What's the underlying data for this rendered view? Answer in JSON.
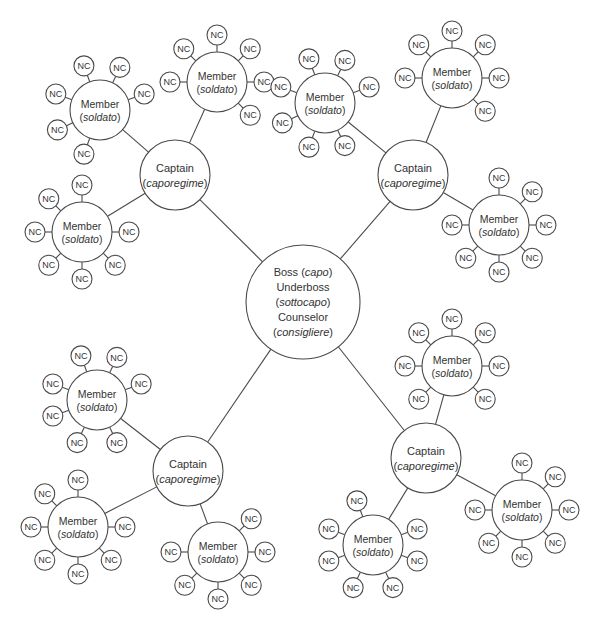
{
  "diagram": {
    "boss": {
      "x": 303,
      "y": 302,
      "r": 57,
      "lines": [
        {
          "text": "Boss (",
          "italic": "capo",
          "after": ")"
        },
        {
          "text": "Underboss",
          "italic": "",
          "after": ""
        },
        {
          "text": "(",
          "italic": "sottocapo",
          "after": ")"
        },
        {
          "text": "Counselor",
          "italic": "",
          "after": ""
        },
        {
          "text": "(",
          "italic": "consigliere",
          "after": ")"
        }
      ]
    },
    "captain_label": {
      "line1": "Captain",
      "line2_pre": "(",
      "line2_italic": "caporegime",
      "line2_post": ")"
    },
    "member_label": {
      "line1": "Member",
      "line2_pre": "(",
      "line2_italic": "soldato",
      "line2_post": ")"
    },
    "nc_label": "NC",
    "captains": [
      {
        "id": "top-left",
        "x": 175,
        "y": 175,
        "r": 35,
        "members": [
          {
            "x": 100,
            "y": 110,
            "r": 30,
            "nc_angles": [
              250,
              295,
              340,
              20,
              60,
              110,
              155,
              200
            ]
          },
          {
            "x": 217,
            "y": 82,
            "r": 30,
            "nc_angles": [
              270,
              225,
              315,
              0,
              180,
              45,
              90,
              135
            ]
          },
          {
            "x": 82,
            "y": 232,
            "r": 30,
            "nc_angles": [
              270,
              225,
              315,
              0,
              180,
              45,
              90,
              135
            ]
          }
        ]
      },
      {
        "id": "top-right",
        "x": 413,
        "y": 175,
        "r": 35,
        "members": [
          {
            "x": 325,
            "y": 103,
            "r": 30,
            "nc_angles": [
              250,
              295,
              340,
              20,
              200,
              110,
              155,
              65
            ]
          },
          {
            "x": 452,
            "y": 78,
            "r": 30,
            "nc_angles": [
              270,
              225,
              315,
              0,
              180,
              45,
              90,
              135
            ]
          },
          {
            "x": 499,
            "y": 225,
            "r": 30,
            "nc_angles": [
              270,
              225,
              315,
              0,
              180,
              45,
              90,
              135
            ]
          }
        ]
      },
      {
        "id": "bottom-left",
        "x": 188,
        "y": 471,
        "r": 35,
        "members": [
          {
            "x": 97,
            "y": 400,
            "r": 30,
            "nc_angles": [
              250,
              295,
              340,
              20,
              200,
              160,
              115,
              65
            ]
          },
          {
            "x": 78,
            "y": 527,
            "r": 30,
            "nc_angles": [
              270,
              225,
              315,
              0,
              180,
              135,
              90,
              45
            ]
          },
          {
            "x": 218,
            "y": 552,
            "r": 30,
            "nc_angles": [
              270,
              225,
              315,
              0,
              180,
              135,
              90,
              45
            ]
          }
        ]
      },
      {
        "id": "bottom-right",
        "x": 426,
        "y": 458,
        "r": 35,
        "members": [
          {
            "x": 452,
            "y": 366,
            "r": 30,
            "nc_angles": [
              270,
              225,
              315,
              0,
              180,
              135,
              90,
              45
            ]
          },
          {
            "x": 522,
            "y": 510,
            "r": 30,
            "nc_angles": [
              270,
              225,
              315,
              0,
              180,
              135,
              90,
              45
            ]
          },
          {
            "x": 373,
            "y": 545,
            "r": 30,
            "nc_angles": [
              250,
              295,
              340,
              20,
              200,
              160,
              115,
              65
            ]
          }
        ]
      }
    ],
    "nc": {
      "r": 10,
      "gap": 7
    },
    "colors": {
      "stroke": "#4a4a4a",
      "text": "#333333",
      "background": "#ffffff"
    }
  }
}
